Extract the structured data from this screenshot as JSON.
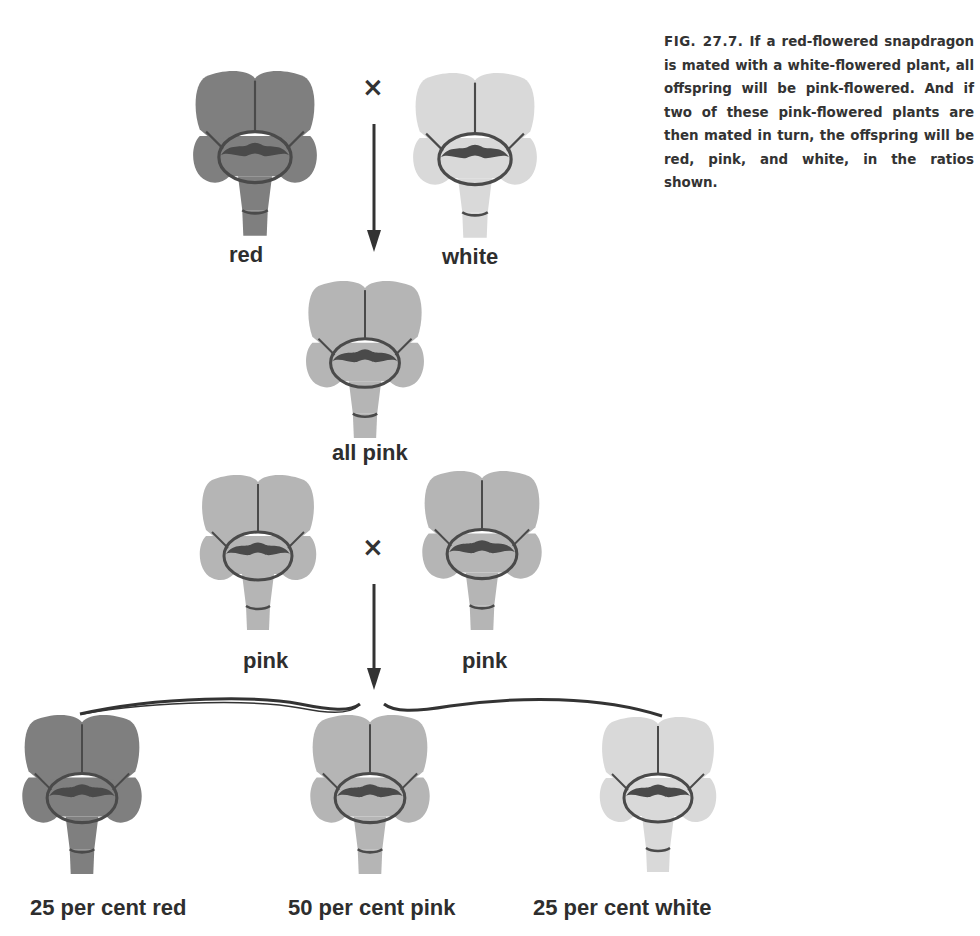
{
  "figure": {
    "number": "FIG. 27.7.",
    "caption": "If a red-flowered snapdragon is mated with a white-flowered plant, all offspring will be pink-flowered. And if two of these pink-flowered plants are then mated in turn, the offspring will be red, pink, and white, in the ratios shown."
  },
  "colors": {
    "red": "#7f7f7f",
    "pink": "#b5b5b5",
    "white": "#d9d9d9",
    "outline": "#4a4a4a"
  },
  "parents": {
    "cross_symbol": "×",
    "left": {
      "label": "red",
      "color": "red"
    },
    "right": {
      "label": "white",
      "color": "white"
    }
  },
  "f1": {
    "label": "all pink",
    "color": "pink"
  },
  "f1_cross": {
    "cross_symbol": "×",
    "left": {
      "label": "pink",
      "color": "pink"
    },
    "right": {
      "label": "pink",
      "color": "pink"
    }
  },
  "f2": [
    {
      "label": "25 per cent red",
      "color": "red",
      "percent": 25
    },
    {
      "label": "50 per cent pink",
      "color": "pink",
      "percent": 50
    },
    {
      "label": "25 per cent white",
      "color": "white",
      "percent": 25
    }
  ]
}
